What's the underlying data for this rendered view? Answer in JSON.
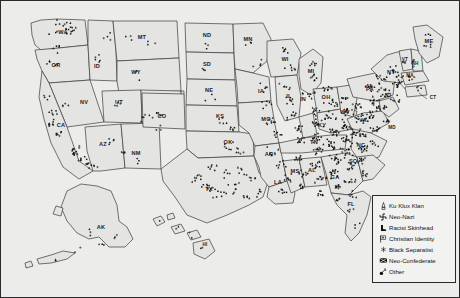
{
  "figure": {
    "kind": "choropleth-point-map",
    "region": "United States",
    "background_color": "#ececeb",
    "land_color": "#e4e4e2",
    "border_color": "#3a3a3a",
    "marker_color": "#1a1a1a"
  },
  "legend": {
    "title": "",
    "background_color": "#f2f2f0",
    "border_color": "#2a2a2a",
    "items": [
      {
        "icon": "klan-hood-icon",
        "label": "Ku Klux Klan"
      },
      {
        "icon": "swastika-cross-icon",
        "label": "Neo-Nazi"
      },
      {
        "icon": "boot-icon",
        "label": "Racist Skinhead"
      },
      {
        "icon": "cross-flag-icon",
        "label": "Christian Identity"
      },
      {
        "icon": "asterisk-icon",
        "label": "Black Separatist"
      },
      {
        "icon": "confederate-flag-icon",
        "label": "Neo-Confederate"
      },
      {
        "icon": "other-mark-icon",
        "label": "Other"
      }
    ]
  },
  "states": [
    {
      "code": "WA",
      "x": 62,
      "y": 33
    },
    {
      "code": "OR",
      "x": 55,
      "y": 66
    },
    {
      "code": "ID",
      "x": 96,
      "y": 67
    },
    {
      "code": "MT",
      "x": 141,
      "y": 38
    },
    {
      "code": "WY",
      "x": 135,
      "y": 73
    },
    {
      "code": "NV",
      "x": 83,
      "y": 103
    },
    {
      "code": "UT",
      "x": 118,
      "y": 103
    },
    {
      "code": "CA",
      "x": 60,
      "y": 126
    },
    {
      "code": "AZ",
      "x": 102,
      "y": 145
    },
    {
      "code": "CO",
      "x": 161,
      "y": 117
    },
    {
      "code": "NM",
      "x": 135,
      "y": 154
    },
    {
      "code": "ND",
      "x": 206,
      "y": 36
    },
    {
      "code": "SD",
      "x": 206,
      "y": 65
    },
    {
      "code": "NE",
      "x": 208,
      "y": 91
    },
    {
      "code": "KS",
      "x": 219,
      "y": 117
    },
    {
      "code": "OK",
      "x": 227,
      "y": 143
    },
    {
      "code": "TX",
      "x": 208,
      "y": 190
    },
    {
      "code": "MN",
      "x": 247,
      "y": 40
    },
    {
      "code": "IA",
      "x": 260,
      "y": 92
    },
    {
      "code": "MO",
      "x": 265,
      "y": 120
    },
    {
      "code": "AR",
      "x": 268,
      "y": 155
    },
    {
      "code": "LA",
      "x": 277,
      "y": 183
    },
    {
      "code": "WI",
      "x": 284,
      "y": 60
    },
    {
      "code": "IL",
      "x": 288,
      "y": 97
    },
    {
      "code": "MS",
      "x": 294,
      "y": 172
    },
    {
      "code": "MI",
      "x": 310,
      "y": 72
    },
    {
      "code": "IN",
      "x": 302,
      "y": 100
    },
    {
      "code": "AL",
      "x": 311,
      "y": 171
    },
    {
      "code": "TN",
      "x": 313,
      "y": 143
    },
    {
      "code": "KY",
      "x": 321,
      "y": 126
    },
    {
      "code": "OH",
      "x": 325,
      "y": 98
    },
    {
      "code": "GA",
      "x": 334,
      "y": 178
    },
    {
      "code": "FL",
      "x": 350,
      "y": 205
    },
    {
      "code": "WV",
      "x": 344,
      "y": 113
    },
    {
      "code": "SC",
      "x": 352,
      "y": 162
    },
    {
      "code": "NC",
      "x": 360,
      "y": 146
    },
    {
      "code": "VA",
      "x": 362,
      "y": 121
    },
    {
      "code": "PA",
      "x": 369,
      "y": 90
    },
    {
      "code": "NY",
      "x": 390,
      "y": 73
    },
    {
      "code": "MD",
      "x": 391,
      "y": 128
    },
    {
      "code": "VT",
      "x": 404,
      "y": 60
    },
    {
      "code": "NH",
      "x": 414,
      "y": 64
    },
    {
      "code": "ME",
      "x": 428,
      "y": 42
    },
    {
      "code": "MA",
      "x": 409,
      "y": 76
    },
    {
      "code": "CT",
      "x": 432,
      "y": 98
    },
    {
      "code": "NJ",
      "x": 387,
      "y": 96
    },
    {
      "code": "AK",
      "x": 100,
      "y": 228
    },
    {
      "code": "HI",
      "x": 204,
      "y": 245
    }
  ],
  "hate_group_markers": {
    "total_described": "dense point cloud, heaviest in the Southeast and mid-Atlantic corridor",
    "dense_regions": [
      "Southeast",
      "Mid-Atlantic",
      "Great Lakes",
      "Southern California",
      "Puget Sound"
    ]
  }
}
